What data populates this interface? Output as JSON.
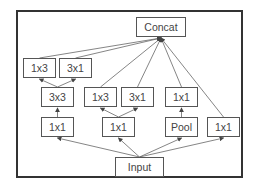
{
  "diagram": {
    "nodes": [
      {
        "id": "concat",
        "label": "Concat",
        "x": 136,
        "y": 17,
        "w": 50,
        "h": 20
      },
      {
        "id": "b1_1x3",
        "label": "1x3",
        "x": 23,
        "y": 58,
        "w": 33,
        "h": 20
      },
      {
        "id": "b1_3x1",
        "label": "3x1",
        "x": 59,
        "y": 58,
        "w": 33,
        "h": 20
      },
      {
        "id": "b1_3x3",
        "label": "3x3",
        "x": 41,
        "y": 87,
        "w": 33,
        "h": 20
      },
      {
        "id": "b2_1x3",
        "label": "1x3",
        "x": 84,
        "y": 87,
        "w": 33,
        "h": 20
      },
      {
        "id": "b2_3x1",
        "label": "3x1",
        "x": 121,
        "y": 87,
        "w": 33,
        "h": 20
      },
      {
        "id": "b3_1x1_top",
        "label": "1x1",
        "x": 165,
        "y": 87,
        "w": 33,
        "h": 20
      },
      {
        "id": "b1_1x1",
        "label": "1x1",
        "x": 41,
        "y": 117,
        "w": 33,
        "h": 20
      },
      {
        "id": "b2_1x1",
        "label": "1x1",
        "x": 102,
        "y": 117,
        "w": 33,
        "h": 20
      },
      {
        "id": "b3_pool",
        "label": "Pool",
        "x": 165,
        "y": 117,
        "w": 33,
        "h": 20
      },
      {
        "id": "b4_1x1",
        "label": "1x1",
        "x": 207,
        "y": 117,
        "w": 33,
        "h": 20
      },
      {
        "id": "input",
        "label": "Input",
        "x": 115,
        "y": 157,
        "w": 49,
        "h": 20
      }
    ],
    "edges": [
      {
        "from": "input",
        "to": "b1_1x1"
      },
      {
        "from": "input",
        "to": "b2_1x1"
      },
      {
        "from": "input",
        "to": "b3_pool"
      },
      {
        "from": "input",
        "to": "b4_1x1"
      },
      {
        "from": "b1_1x1",
        "to": "b1_3x3"
      },
      {
        "from": "b1_3x3",
        "to": "b1_1x3"
      },
      {
        "from": "b1_3x3",
        "to": "b1_3x1"
      },
      {
        "from": "b2_1x1",
        "to": "b2_1x3"
      },
      {
        "from": "b2_1x1",
        "to": "b2_3x1"
      },
      {
        "from": "b3_pool",
        "to": "b3_1x1_top"
      },
      {
        "from": "b1_1x3",
        "to": "concat"
      },
      {
        "from": "b1_3x1",
        "to": "concat"
      },
      {
        "from": "b2_1x3",
        "to": "concat"
      },
      {
        "from": "b2_3x1",
        "to": "concat"
      },
      {
        "from": "b3_1x1_top",
        "to": "concat"
      },
      {
        "from": "b4_1x1",
        "to": "concat"
      }
    ]
  }
}
